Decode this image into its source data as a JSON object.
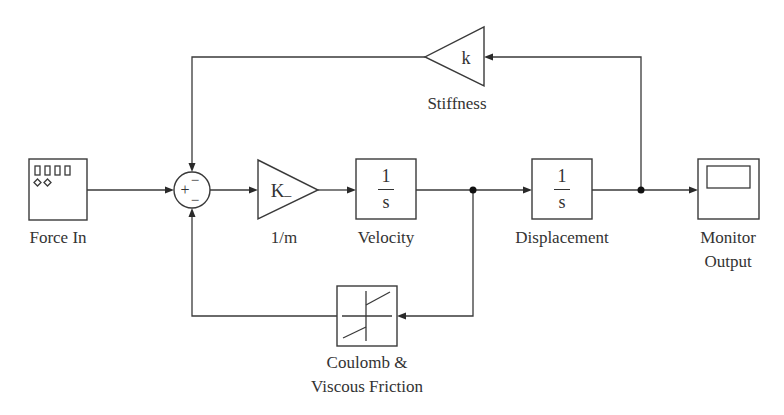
{
  "diagram": {
    "type": "simulink-block-diagram",
    "colors": {
      "line": "#3a3a3a",
      "text": "#333333",
      "background": "#ffffff"
    },
    "blocks": {
      "force_in": {
        "label": "Force In",
        "icon": "signal-generator-icon"
      },
      "sum": {
        "signs_left": "+",
        "signs_top": "−",
        "signs_bottom": "−"
      },
      "gain": {
        "label": "1/m",
        "text": "K",
        "subscript": "–"
      },
      "velocity": {
        "label": "Velocity",
        "numerator": "1",
        "denominator": "s"
      },
      "displacement": {
        "label": "Displacement",
        "numerator": "1",
        "denominator": "s"
      },
      "monitor": {
        "label_line1": "Monitor",
        "label_line2": "Output",
        "icon": "scope-icon"
      },
      "stiffness": {
        "label": "Stiffness",
        "text": "k"
      },
      "friction": {
        "label_line1": "Coulomb &",
        "label_line2": "Viscous Friction",
        "icon": "coulomb-friction-icon"
      }
    },
    "connections": [
      {
        "from": "Force In",
        "to": "Sum (+)"
      },
      {
        "from": "Sum",
        "to": "1/m"
      },
      {
        "from": "1/m",
        "to": "Velocity"
      },
      {
        "from": "Velocity",
        "to": "Displacement"
      },
      {
        "from": "Velocity",
        "to": "Coulomb & Viscous Friction"
      },
      {
        "from": "Coulomb & Viscous Friction",
        "to": "Sum (− bottom)"
      },
      {
        "from": "Displacement",
        "to": "Monitor Output"
      },
      {
        "from": "Displacement",
        "to": "Stiffness"
      },
      {
        "from": "Stiffness",
        "to": "Sum (− top)"
      }
    ]
  }
}
